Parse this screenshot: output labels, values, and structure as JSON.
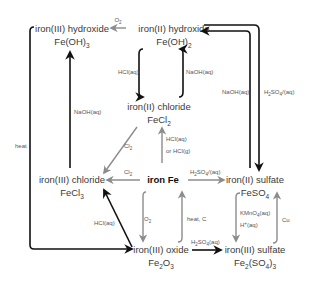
{
  "nodes": {
    "fe_oh3": {
      "name": "iron(III) hydroxide",
      "formula_base": "Fe(OH)",
      "formula_sub": "3"
    },
    "fe_oh2": {
      "name": "iron(II) hydroxide",
      "formula_base": "Fe(OH)",
      "formula_sub": "2"
    },
    "fecl2": {
      "name": "iron(II) chloride",
      "formula_base": "FeCl",
      "formula_sub": "2"
    },
    "fecl3": {
      "name": "iron(III) chloride",
      "formula_base": "FeCl",
      "formula_sub": "3"
    },
    "fe": {
      "name": "iron Fe"
    },
    "feso4": {
      "name": "iron(II) sulfate",
      "formula_base": "FeSO",
      "formula_sub": "4"
    },
    "fe2o3": {
      "name": "iron(III) oxide",
      "formula_a": "Fe",
      "formula_sub1": "2",
      "formula_b": "O",
      "formula_sub2": "3"
    },
    "fe2so43": {
      "name": "iron(III) sulfate",
      "formula_a": "Fe",
      "formula_sub1": "2",
      "formula_b": "(SO",
      "formula_sub2": "4",
      "formula_c": ")",
      "formula_sub3": "3"
    }
  },
  "reagents": {
    "o2_top": {
      "base": "O",
      "sub": "2"
    },
    "hcl_aq_left": "HCl(aq)",
    "naoh_aq_mid": "NaOH(aq)",
    "naoh_aq_left": "NaOH(aq)",
    "naoh_aq_right": "NaOH(aq)",
    "h2so4_right": {
      "a": "H",
      "sub1": "2",
      "b": "SO",
      "sub2": "4",
      "c": "/(aq)"
    },
    "cl2_diag": {
      "base": "Cl",
      "sub": "2"
    },
    "cl2_horiz": {
      "base": "Cl",
      "sub": "2"
    },
    "hcl_fe_line1": "HCl(aq)",
    "hcl_fe_line2": "or HCl(g)",
    "h2so4_fe": {
      "a": "H",
      "sub1": "2",
      "b": "SO",
      "sub2": "4",
      "c": "/(aq)"
    },
    "heat": "heat",
    "hcl_aq_oxide": "HCl(aq)",
    "o2_down": {
      "base": "O",
      "sub": "2"
    },
    "heat_c": "heat, C",
    "h2so4_oxide": {
      "a": "H",
      "sub1": "2",
      "b": "SO",
      "sub2": "4",
      "c": "(aq)"
    },
    "kmno4_line1": {
      "a": "KMnO",
      "sub": "4",
      "b": "(aq)"
    },
    "kmno4_line2": {
      "a": "H",
      "sup": "+",
      "b": "(aq)"
    },
    "cu": "Cu"
  },
  "colors": {
    "dark_arrow": "#111111",
    "grey_arrow": "#8c8c8c",
    "text": "#3a3a3a"
  }
}
